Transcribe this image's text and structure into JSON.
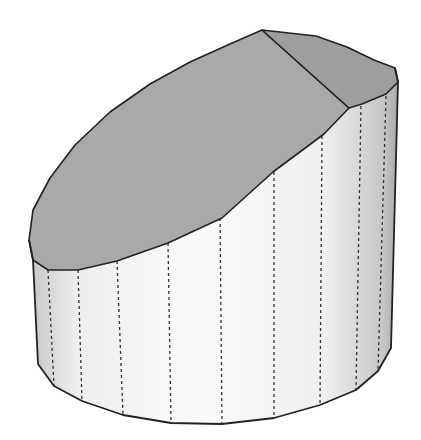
{
  "figure": {
    "colors": {
      "background": "#ffffff",
      "cut_face": "#a9a9a9",
      "cut_face_dark": "#9e9e9e",
      "side_light": "#f7f7f7",
      "side_shade": "#c8c8c8",
      "edge": "#222222",
      "hidden_edge": "#333333"
    },
    "vertical_edges_count": 12
  }
}
